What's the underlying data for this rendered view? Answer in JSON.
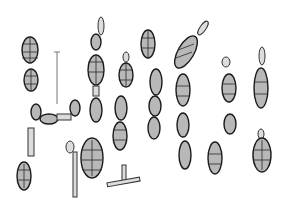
{
  "figure": {
    "scale_bar": {
      "visible": true,
      "label": ""
    },
    "colors": {
      "background": "#ffffff",
      "ink": "#1a1a1a",
      "fill": "#b8b8b8"
    }
  }
}
